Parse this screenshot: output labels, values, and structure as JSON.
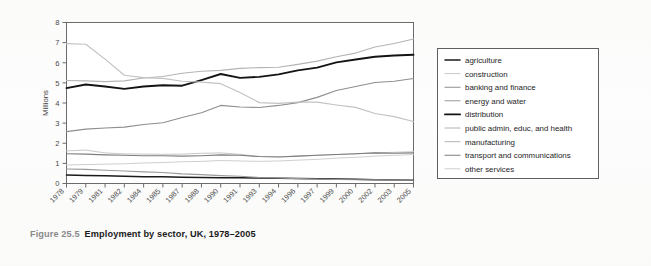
{
  "caption": {
    "figure_number": "Figure 25.5",
    "title": "Employment by sector, UK, 1978–2005"
  },
  "chart_data": {
    "type": "line",
    "title": "",
    "xlabel": "",
    "ylabel": "Millions",
    "ylim": [
      0,
      8
    ],
    "yticks": [
      0,
      1,
      2,
      3,
      4,
      5,
      6,
      7,
      8
    ],
    "grid": false,
    "legend_position": "right-outside",
    "x": [
      1978,
      1979,
      1981,
      1982,
      1984,
      1985,
      1987,
      1988,
      1990,
      1991,
      1993,
      1994,
      1996,
      1997,
      1999,
      2000,
      2002,
      2003,
      2005
    ],
    "xtick_labels": [
      "1978",
      "1979",
      "1981",
      "1982",
      "1984",
      "1985",
      "1987",
      "1988",
      "1990",
      "1991",
      "1993",
      "1994",
      "1996",
      "1997",
      "1999",
      "2000",
      "2002",
      "2003",
      "2005"
    ],
    "series": [
      {
        "name": "agriculture",
        "color": "#1a1a1a",
        "width": 1.5,
        "values": [
          0.42,
          0.4,
          0.38,
          0.36,
          0.34,
          0.33,
          0.31,
          0.3,
          0.29,
          0.28,
          0.27,
          0.26,
          0.25,
          0.24,
          0.22,
          0.21,
          0.19,
          0.18,
          0.16
        ]
      },
      {
        "name": "construction",
        "color": "#c8c8c8",
        "width": 1.0,
        "values": [
          1.62,
          1.66,
          1.52,
          1.47,
          1.46,
          1.45,
          1.46,
          1.5,
          1.52,
          1.45,
          1.34,
          1.33,
          1.36,
          1.4,
          1.44,
          1.47,
          1.52,
          1.55,
          1.58
        ]
      },
      {
        "name": "banking and finance",
        "color": "#8e8e8e",
        "width": 1.1,
        "values": [
          2.58,
          2.7,
          2.76,
          2.8,
          2.93,
          3.02,
          3.28,
          3.52,
          3.88,
          3.8,
          3.78,
          3.88,
          4.02,
          4.28,
          4.62,
          4.82,
          5.02,
          5.08,
          5.22
        ]
      },
      {
        "name": "energy and water",
        "color": "#9a9a9a",
        "width": 1.1,
        "values": [
          0.72,
          0.7,
          0.66,
          0.62,
          0.58,
          0.55,
          0.48,
          0.44,
          0.39,
          0.36,
          0.3,
          0.28,
          0.24,
          0.22,
          0.2,
          0.19,
          0.18,
          0.17,
          0.16
        ]
      },
      {
        "name": "distribution",
        "color": "#141414",
        "width": 1.9,
        "values": [
          4.74,
          4.92,
          4.82,
          4.7,
          4.82,
          4.88,
          4.86,
          5.14,
          5.44,
          5.25,
          5.3,
          5.42,
          5.62,
          5.76,
          6.02,
          6.16,
          6.3,
          6.36,
          6.4
        ]
      },
      {
        "name": "public admin, educ, and health",
        "color": "#b4b4b4",
        "width": 1.1,
        "values": [
          5.12,
          5.1,
          5.06,
          5.1,
          5.24,
          5.32,
          5.48,
          5.58,
          5.62,
          5.72,
          5.76,
          5.78,
          5.92,
          6.08,
          6.3,
          6.48,
          6.78,
          6.96,
          7.18
        ]
      },
      {
        "name": "manufacturing",
        "color": "#c2c2c2",
        "width": 1.2,
        "values": [
          6.95,
          6.92,
          6.18,
          5.38,
          5.26,
          5.22,
          5.08,
          5.04,
          4.96,
          4.52,
          4.02,
          3.98,
          4.04,
          4.04,
          3.9,
          3.78,
          3.48,
          3.32,
          3.08
        ]
      },
      {
        "name": "transport and communications",
        "color": "#7e7e7e",
        "width": 1.1,
        "values": [
          1.48,
          1.46,
          1.42,
          1.4,
          1.38,
          1.38,
          1.36,
          1.38,
          1.42,
          1.4,
          1.34,
          1.32,
          1.36,
          1.4,
          1.44,
          1.48,
          1.52,
          1.5,
          1.52
        ]
      },
      {
        "name": "other services",
        "color": "#cfcfcf",
        "width": 1.0,
        "values": [
          0.92,
          0.94,
          0.96,
          0.98,
          1.02,
          1.04,
          1.08,
          1.1,
          1.14,
          1.12,
          1.1,
          1.12,
          1.16,
          1.2,
          1.26,
          1.3,
          1.36,
          1.4,
          1.44
        ]
      }
    ]
  },
  "legend": {
    "items": [
      "agriculture",
      "construction",
      "banking and finance",
      "energy and water",
      "distribution",
      "public admin, educ, and health",
      "manufacturing",
      "transport and communications",
      "other services"
    ]
  }
}
